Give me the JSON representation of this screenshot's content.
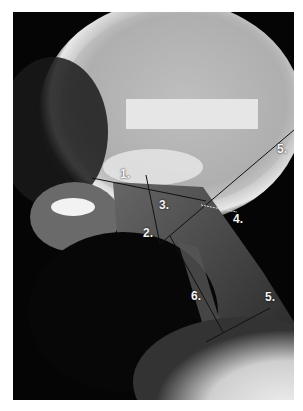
{
  "image": {
    "type": "lateral skull and cervical spine radiograph",
    "redaction_box": "blank rectangle",
    "background_color": "#ffffff",
    "line_color": "#111111"
  },
  "annotations": {
    "label_1": "1.",
    "label_2": "2.",
    "label_3": "3.",
    "label_4": "4.",
    "label_5_upper": "5.",
    "label_5_lower": "5.",
    "label_6": "6."
  }
}
